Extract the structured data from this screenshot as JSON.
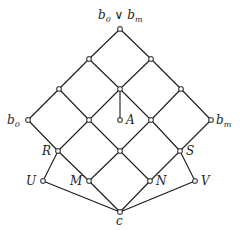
{
  "diagram": {
    "type": "lattice",
    "nodes": [
      {
        "id": "top",
        "x": 120,
        "y": 29,
        "label": "b0 ∨ bm"
      },
      {
        "id": "l2a",
        "x": 89,
        "y": 59,
        "label": ""
      },
      {
        "id": "l2b",
        "x": 151,
        "y": 59,
        "label": ""
      },
      {
        "id": "l3a",
        "x": 59,
        "y": 89,
        "label": ""
      },
      {
        "id": "l3b",
        "x": 120,
        "y": 89,
        "label": ""
      },
      {
        "id": "l3c",
        "x": 181,
        "y": 89,
        "label": ""
      },
      {
        "id": "b0",
        "x": 28,
        "y": 120,
        "label": "b0"
      },
      {
        "id": "l4a",
        "x": 89,
        "y": 120,
        "label": ""
      },
      {
        "id": "A",
        "x": 120,
        "y": 120,
        "label": "A"
      },
      {
        "id": "l4b",
        "x": 151,
        "y": 120,
        "label": ""
      },
      {
        "id": "bm",
        "x": 211,
        "y": 120,
        "label": "bm"
      },
      {
        "id": "R",
        "x": 58,
        "y": 151,
        "label": "R"
      },
      {
        "id": "mid",
        "x": 120,
        "y": 151,
        "label": ""
      },
      {
        "id": "S",
        "x": 180,
        "y": 151,
        "label": "S"
      },
      {
        "id": "U",
        "x": 43,
        "y": 181,
        "label": "U"
      },
      {
        "id": "M",
        "x": 89,
        "y": 181,
        "label": "M"
      },
      {
        "id": "N",
        "x": 150,
        "y": 181,
        "label": "N"
      },
      {
        "id": "V",
        "x": 195,
        "y": 181,
        "label": "V"
      },
      {
        "id": "c",
        "x": 120,
        "y": 212,
        "label": "c"
      }
    ],
    "edges": [
      [
        "top",
        "l2a"
      ],
      [
        "top",
        "l2b"
      ],
      [
        "l2a",
        "l3a"
      ],
      [
        "l2a",
        "l3b"
      ],
      [
        "l2b",
        "l3b"
      ],
      [
        "l2b",
        "l3c"
      ],
      [
        "l3a",
        "b0"
      ],
      [
        "l3a",
        "l4a"
      ],
      [
        "l3b",
        "l4a"
      ],
      [
        "l3b",
        "l4b"
      ],
      [
        "l3b",
        "A"
      ],
      [
        "l3c",
        "l4b"
      ],
      [
        "l3c",
        "bm"
      ],
      [
        "b0",
        "R"
      ],
      [
        "l4a",
        "R"
      ],
      [
        "l4a",
        "mid"
      ],
      [
        "l4b",
        "mid"
      ],
      [
        "l4b",
        "S"
      ],
      [
        "bm",
        "S"
      ],
      [
        "R",
        "U"
      ],
      [
        "R",
        "M"
      ],
      [
        "mid",
        "M"
      ],
      [
        "mid",
        "N"
      ],
      [
        "S",
        "N"
      ],
      [
        "S",
        "V"
      ],
      [
        "U",
        "c"
      ],
      [
        "M",
        "c"
      ],
      [
        "N",
        "c"
      ],
      [
        "V",
        "c"
      ]
    ]
  },
  "labels": {
    "top": {
      "base1": "b",
      "sub1": "0",
      "op": " ∨ ",
      "base2": "b",
      "sub2": "m"
    },
    "b0": {
      "base": "b",
      "sub": "0"
    },
    "bm": {
      "base": "b",
      "sub": "m"
    },
    "A": "A",
    "R": "R",
    "S": "S",
    "U": "U",
    "M": "M",
    "N": "N",
    "V": "V",
    "c": "c"
  }
}
